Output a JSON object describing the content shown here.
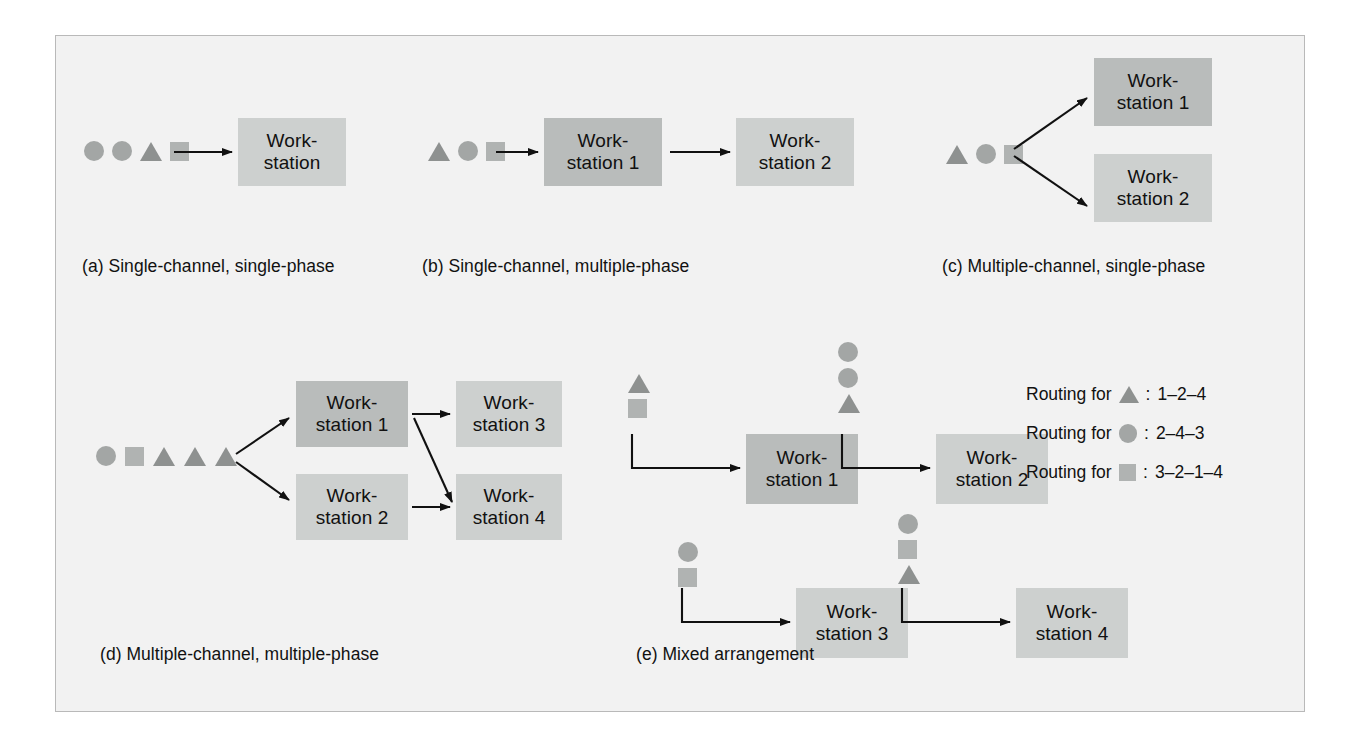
{
  "figure": {
    "background": "#f2f2f2",
    "border_color": "#b9b9b9",
    "box_dark": "#b9bcbb",
    "box_light": "#cdd0cf",
    "shape_circle_color": "#a3a6a5",
    "shape_square_color": "#b0b3b2",
    "shape_triangle_color": "#8e9190"
  },
  "panels": {
    "a": {
      "caption": "(a) Single-channel, single-phase",
      "queue": [
        "circle",
        "circle",
        "triangle",
        "square"
      ],
      "boxes": [
        {
          "label": "Work-\nstation",
          "shade": "light"
        }
      ]
    },
    "b": {
      "caption": "(b) Single-channel, multiple-phase",
      "queue": [
        "triangle",
        "circle",
        "square"
      ],
      "boxes": [
        {
          "label": "Work-\nstation 1",
          "shade": "dark"
        },
        {
          "label": "Work-\nstation 2",
          "shade": "light"
        }
      ]
    },
    "c": {
      "caption": "(c) Multiple-channel, single-phase",
      "queue": [
        "triangle",
        "circle",
        "square"
      ],
      "boxes": [
        {
          "label": "Work-\nstation 1",
          "shade": "dark"
        },
        {
          "label": "Work-\nstation 2",
          "shade": "light"
        }
      ]
    },
    "d": {
      "caption": "(d) Multiple-channel, multiple-phase",
      "queue": [
        "circle",
        "square",
        "triangle",
        "triangle",
        "triangle"
      ],
      "boxes": [
        {
          "label": "Work-\nstation 1",
          "shade": "dark"
        },
        {
          "label": "Work-\nstation 2",
          "shade": "light"
        },
        {
          "label": "Work-\nstation 3",
          "shade": "light"
        },
        {
          "label": "Work-\nstation 4",
          "shade": "light"
        }
      ]
    },
    "e": {
      "caption": "(e) Mixed arrangement",
      "boxes": [
        {
          "label": "Work-\nstation 1",
          "shade": "dark",
          "queue": [
            "triangle",
            "square"
          ]
        },
        {
          "label": "Work-\nstation 2",
          "shade": "light",
          "queue": [
            "circle",
            "circle",
            "triangle"
          ]
        },
        {
          "label": "Work-\nstation 3",
          "shade": "light",
          "queue": [
            "circle",
            "square"
          ]
        },
        {
          "label": "Work-\nstation 4",
          "shade": "light",
          "queue": [
            "circle",
            "square",
            "triangle"
          ]
        }
      ],
      "legend": [
        {
          "prefix": "Routing for",
          "shape": "triangle",
          "separator": ":",
          "route": "1–2–4"
        },
        {
          "prefix": "Routing for",
          "shape": "circle",
          "separator": ":",
          "route": "2–4–3"
        },
        {
          "prefix": "Routing for",
          "shape": "square",
          "separator": ":",
          "route": "3–2–1–4"
        }
      ]
    }
  }
}
